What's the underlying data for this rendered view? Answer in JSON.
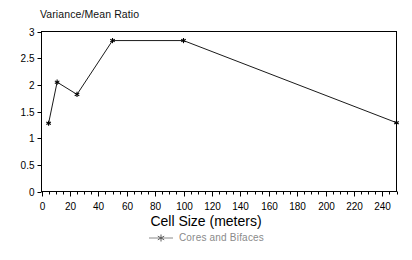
{
  "chart_data": {
    "type": "line",
    "title": "Variance/Mean Ratio",
    "xlabel": "Cell Size (meters)",
    "ylabel": "",
    "xlim": [
      0,
      250
    ],
    "ylim": [
      0,
      3
    ],
    "grid": false,
    "legend_position": "bottom",
    "x_major_step": 20,
    "x_minor_step": 5,
    "y_major_step": 0.5,
    "xticklabels": [
      "0",
      "20",
      "40",
      "60",
      "80",
      "100",
      "120",
      "140",
      "160",
      "180",
      "200",
      "220",
      "240"
    ],
    "xtickvalues": [
      0,
      20,
      40,
      60,
      80,
      100,
      120,
      140,
      160,
      180,
      200,
      220,
      240
    ],
    "yticklabels": [
      "0",
      "0.5",
      "1",
      "1.5",
      "2",
      "2.5",
      "3"
    ],
    "ytickvalues": [
      0,
      0.5,
      1,
      1.5,
      2,
      2.5,
      3
    ],
    "series": [
      {
        "name": "Cores and Bifaces",
        "marker": "star",
        "color": "#000000",
        "x": [
          5,
          11,
          25,
          50,
          100,
          250
        ],
        "values": [
          1.28,
          2.05,
          1.82,
          2.83,
          2.83,
          1.29
        ]
      }
    ]
  },
  "legend": {
    "entries": [
      {
        "label": "Cores and Bifaces",
        "color": "#8a8a8a",
        "marker": "star-line"
      }
    ]
  }
}
